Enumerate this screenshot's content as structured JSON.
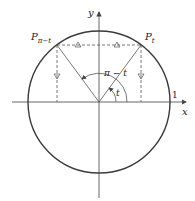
{
  "diagram": {
    "labels": {
      "y_axis": "y",
      "x_axis": "x",
      "one": "1",
      "p_left_main": "P",
      "p_left_sub": "π−t",
      "p_right_main": "P",
      "p_right_sub": "t",
      "angle_big": "π − t",
      "angle_small": "t"
    },
    "colors": {
      "circle": "#3a3a3a",
      "axes": "#555555",
      "lines": "#555555",
      "dashed": "#555555"
    }
  }
}
